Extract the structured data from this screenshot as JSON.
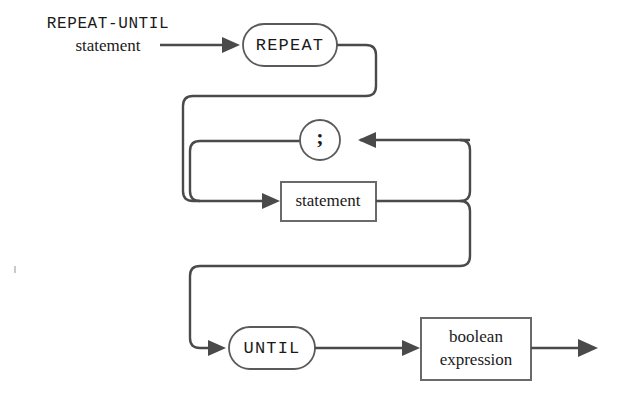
{
  "diagram": {
    "kind": "railroad-syntax-diagram",
    "title_line1": "REPEAT-UNTIL",
    "title_line2": "statement",
    "nodes": {
      "repeat_terminal": "REPEAT",
      "semicolon_terminal": ";",
      "statement_nonterminal": "statement",
      "until_terminal": "UNTIL",
      "boolean_expression_line1": "boolean",
      "boolean_expression_line2": "expression"
    },
    "colors": {
      "line": "#4a4a4a",
      "node_stroke": "#5a5a5a",
      "box_stroke": "#6a6a6a",
      "text": "#1a1a1a",
      "background": "#ffffff"
    }
  }
}
